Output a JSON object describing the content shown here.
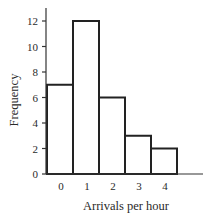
{
  "chart_data": {
    "type": "bar",
    "subtype": "histogram",
    "title": "",
    "xlabel": "Arrivals per hour",
    "ylabel": "Frequency",
    "categories": [
      "0",
      "1",
      "2",
      "3",
      "4"
    ],
    "values": [
      7,
      12,
      6,
      3,
      2
    ],
    "ylim": [
      0,
      12
    ],
    "yticks": [
      "0",
      "2",
      "4",
      "6",
      "8",
      "10",
      "12"
    ],
    "ytick_values": [
      0,
      2,
      4,
      6,
      8,
      10,
      12
    ],
    "grid": false,
    "legend": "none",
    "colors": {
      "bar_fill": "#ffffff",
      "bar_edge": "#222222",
      "text": "#2a2a2a"
    }
  }
}
